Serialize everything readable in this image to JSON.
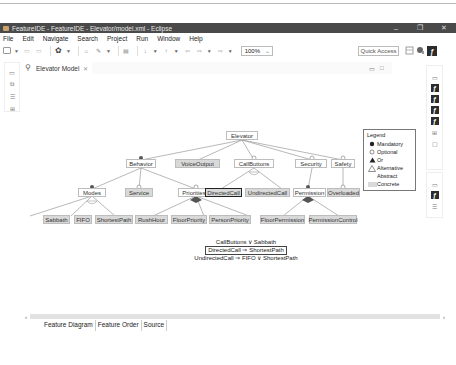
{
  "window": {
    "title": "FeatureIDE - FeatureIDE - Elevator/model.xml - Eclipse",
    "controls": {
      "minimize": "–",
      "maximize": "❐",
      "close": "✕"
    }
  },
  "menu": [
    "File",
    "Edit",
    "Navigate",
    "Search",
    "Project",
    "Run",
    "Window",
    "Help"
  ],
  "toolbar": {
    "zoom_value": "100%",
    "zoom_dropdown": "⌄",
    "quick_access": "Quick Access"
  },
  "editor": {
    "tab_label": "Elevator Model",
    "tab_close": "✕",
    "bottom_tabs": [
      "Feature Diagram",
      "Feature Order",
      "Source"
    ]
  },
  "diagram": {
    "root": "Elevator",
    "features": {
      "behavior": "Behavior",
      "voice_output": "VoiceOutput",
      "call_buttons": "CallButtons",
      "security": "Security",
      "safety": "Safety",
      "modes": "Modes",
      "service": "Service",
      "priorities": "Priorities",
      "directed_call": "DirectedCall",
      "undirected_call": "UndirectedCall",
      "permission": "Permission",
      "overloaded": "Overloaded",
      "sabbath": "Sabbath",
      "fifo": "FIFO",
      "shortest_path": "ShortestPath",
      "rush_hour": "RushHour",
      "floor_priority": "FloorPriority",
      "person_priority": "PersonPriority",
      "floor_permission": "FloorPermission",
      "permission_control": "PermissionControl"
    },
    "constraints": [
      "CallButtons ∨ Sabbath",
      "DirectedCall ⇒ ShortestPath",
      "UndirectedCall ⇒ FIFO ∨ ShortestPath"
    ]
  },
  "legend": {
    "title": "Legend",
    "items": [
      "Mandatory",
      "Optional",
      "Or",
      "Alternative",
      "Abstract",
      "Concrete"
    ]
  },
  "colors": {
    "titlebar": "#4a4a4a",
    "concrete_fill": "#d9d9d9",
    "abstract_fill": "#ffffff",
    "line": "#999999",
    "selected_border": "#222222"
  }
}
